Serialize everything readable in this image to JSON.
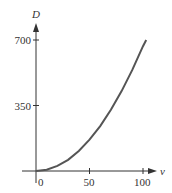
{
  "chart_data": {
    "type": "line",
    "title": "",
    "xlabel": "v",
    "ylabel": "D",
    "x_ticks": [
      "0",
      "50",
      "100"
    ],
    "y_ticks": [
      "350",
      "700"
    ],
    "xlim": [
      0,
      110
    ],
    "ylim": [
      0,
      760
    ],
    "grid": false,
    "legend": null,
    "series": [
      {
        "name": "D(v)",
        "x": [
          0,
          10,
          20,
          30,
          40,
          50,
          60,
          70,
          80,
          90,
          100,
          103
        ],
        "y": [
          0,
          7,
          27,
          60,
          107,
          167,
          240,
          327,
          427,
          540,
          667,
          700
        ]
      }
    ],
    "colors": {
      "curve": "#555555",
      "axis": "#333333"
    }
  }
}
